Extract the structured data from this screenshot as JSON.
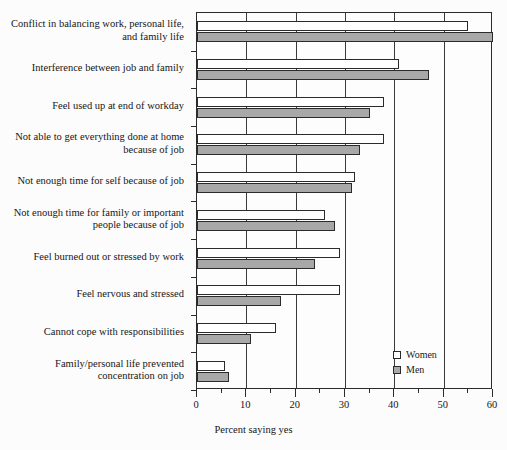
{
  "chart_data": {
    "type": "bar",
    "orientation": "horizontal",
    "title": "",
    "xlabel": "Percent saying yes",
    "ylabel": "",
    "xlim": [
      0,
      60
    ],
    "xticks": [
      0,
      10,
      20,
      30,
      40,
      50,
      60
    ],
    "xtick_labels": [
      "0",
      "10",
      "20",
      "30",
      "40",
      "50",
      "60"
    ],
    "xminor_ticks": [
      5,
      15,
      25,
      35,
      45,
      55
    ],
    "grid": true,
    "legend_position": "bottom-right",
    "categories": [
      "Conflict in balancing work, personal life, and family life",
      "Interference between job and family",
      "Feel used up at end of workday",
      "Not able to get everything done at home because of job",
      "Not enough time for self because of job",
      "Not enough time for family or important people because of job",
      "Feel burned out or stressed by work",
      "Feel nervous and stressed",
      "Cannot cope with responsibilities",
      "Family/personal life prevented concentration on job"
    ],
    "series": [
      {
        "name": "Women",
        "color": "#ffffff",
        "values": [
          55,
          41,
          38,
          38,
          32,
          26,
          29,
          29,
          16,
          5.7
        ]
      },
      {
        "name": "Men",
        "color": "#a8a8a8",
        "values": [
          60,
          47,
          35,
          33,
          31.5,
          28,
          24,
          17,
          11,
          6.5
        ]
      }
    ]
  },
  "legend": {
    "items": [
      {
        "label": "Women"
      },
      {
        "label": "Men"
      }
    ]
  },
  "colors": {
    "women_fill": "#ffffff",
    "men_fill": "#a8a8a8",
    "axis": "#2b2b2b",
    "background": "#fcfcfc"
  }
}
